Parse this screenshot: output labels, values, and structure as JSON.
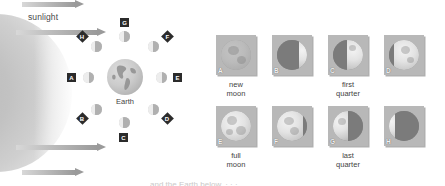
{
  "diagram": {
    "sunlight_label": "sunlight",
    "earth_label": "Earth",
    "sun_name": "sun",
    "orbit_positions": [
      {
        "letter": "A",
        "shape": "square",
        "phase": "half-left-lit"
      },
      {
        "letter": "B",
        "shape": "diamond",
        "phase": "crescent"
      },
      {
        "letter": "C",
        "shape": "square",
        "phase": "gibbous"
      },
      {
        "letter": "D",
        "shape": "diamond",
        "phase": "gibbous"
      },
      {
        "letter": "E",
        "shape": "square",
        "phase": "half-right-lit"
      },
      {
        "letter": "F",
        "shape": "diamond",
        "phase": "gibbous"
      },
      {
        "letter": "G",
        "shape": "square",
        "phase": "gibbous"
      },
      {
        "letter": "H",
        "shape": "diamond",
        "phase": "crescent"
      }
    ]
  },
  "photos": {
    "row_top": [
      {
        "letter": "A",
        "caption": "new\nmoon"
      },
      {
        "letter": "B",
        "caption": ""
      },
      {
        "letter": "C",
        "caption": "first\nquarter"
      },
      {
        "letter": "D",
        "caption": ""
      }
    ],
    "row_bottom": [
      {
        "letter": "E",
        "caption": "full\nmoon"
      },
      {
        "letter": "F",
        "caption": ""
      },
      {
        "letter": "G",
        "caption": "last\nquarter"
      },
      {
        "letter": "H",
        "caption": ""
      }
    ],
    "captions": {
      "new_moon_1": "new",
      "new_moon_2": "moon",
      "first_quarter_1": "first",
      "first_quarter_2": "quarter",
      "full_moon_1": "full",
      "full_moon_2": "moon",
      "last_quarter_1": "last",
      "last_quarter_2": "quarter"
    }
  },
  "footer": {
    "clipped_text": "and the Earth below. · · ·"
  },
  "colors": {
    "ink": "#3f3f3f",
    "badge_bg": "#2b2b2b",
    "badge_fg": "#ffffff",
    "panel_bg": "#b8b8b8",
    "arrow": "#9a9a9a"
  }
}
